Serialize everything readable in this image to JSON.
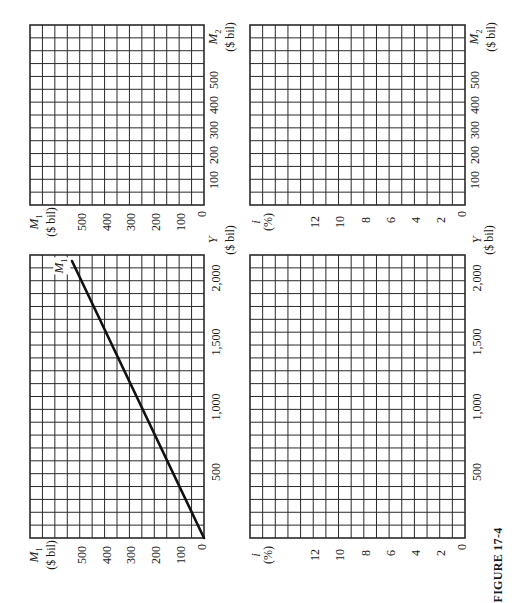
{
  "figure": {
    "caption": "FIGURE 17-4",
    "orientation": "page rotated 90° counter-clockwise"
  },
  "panels": {
    "top_left": {
      "x_axis_title": {
        "var": "M",
        "sub": "2",
        "unit": "($ bil)"
      },
      "x_ticks": [
        "100",
        "200",
        "300",
        "400",
        "500"
      ],
      "y_axis_title": {
        "var": "M",
        "sub": "1",
        "unit": "($ bil)"
      },
      "y_ticks": [
        "500",
        "400",
        "300",
        "200",
        "100",
        "0"
      ]
    },
    "top_right": {
      "x_axis_title": {
        "var": "M",
        "sub": "2",
        "unit": "($ bil)"
      },
      "x_ticks": [
        "100",
        "200",
        "300",
        "400",
        "500"
      ],
      "y_axis_title": {
        "var": "i",
        "sub": "",
        "unit": "(%)"
      },
      "y_ticks": [
        "12",
        "10",
        "8",
        "6",
        "4",
        "2",
        "0"
      ]
    },
    "bottom_left": {
      "x_axis_title": {
        "var": "Y",
        "sub": "",
        "unit": "($ bil)"
      },
      "x_ticks": [
        "500",
        "1,000",
        "1,500",
        "2,000"
      ],
      "y_axis_title": {
        "var": "M",
        "sub": "1",
        "unit": "($ bil)"
      },
      "y_ticks": [
        "500",
        "400",
        "300",
        "200",
        "100",
        "0"
      ],
      "line_label": {
        "var": "M",
        "sub": "1"
      }
    },
    "bottom_right": {
      "x_axis_title": {
        "var": "Y",
        "sub": "",
        "unit": "($ bil)"
      },
      "x_ticks": [
        "500",
        "1,000",
        "1,500",
        "2,000"
      ],
      "y_axis_title": {
        "var": "i",
        "sub": "",
        "unit": "(%)"
      },
      "y_ticks": [
        "12",
        "10",
        "8",
        "6",
        "4",
        "2",
        "0"
      ]
    }
  },
  "chart_data": [
    {
      "type": "line",
      "title": "Top-left: M1 vs M2 (blank grid)",
      "xlabel": "M2 ($ bil)",
      "ylabel": "M1 ($ bil)",
      "xlim": [
        0,
        560
      ],
      "ylim": [
        0,
        560
      ],
      "x_ticks": [
        100,
        200,
        300,
        400,
        500
      ],
      "y_ticks": [
        0,
        100,
        200,
        300,
        400,
        500
      ],
      "grid": true,
      "series": []
    },
    {
      "type": "line",
      "title": "Top-right: i vs M2 (blank grid)",
      "xlabel": "M2 ($ bil)",
      "ylabel": "i (%)",
      "xlim": [
        0,
        560
      ],
      "ylim": [
        0,
        14
      ],
      "x_ticks": [
        100,
        200,
        300,
        400,
        500
      ],
      "y_ticks": [
        0,
        2,
        4,
        6,
        8,
        10,
        12
      ],
      "grid": true,
      "series": []
    },
    {
      "type": "line",
      "title": "Bottom-left: M1 vs Y",
      "xlabel": "Y ($ bil)",
      "ylabel": "M1 ($ bil)",
      "xlim": [
        0,
        2180
      ],
      "ylim": [
        0,
        560
      ],
      "x_ticks": [
        500,
        1000,
        1500,
        2000
      ],
      "y_ticks": [
        0,
        100,
        200,
        300,
        400,
        500
      ],
      "grid": true,
      "series": [
        {
          "name": "M1",
          "x": [
            0,
            500,
            1000,
            1500,
            2000,
            2130
          ],
          "y": [
            0,
            125,
            250,
            375,
            500,
            532
          ]
        }
      ],
      "annotations": [
        "M1 (line label near top end)"
      ]
    },
    {
      "type": "line",
      "title": "Bottom-right: i vs Y (blank grid)",
      "xlabel": "Y ($ bil)",
      "ylabel": "i (%)",
      "xlim": [
        0,
        2180
      ],
      "ylim": [
        0,
        14
      ],
      "x_ticks": [
        500,
        1000,
        1500,
        2000
      ],
      "y_ticks": [
        0,
        2,
        4,
        6,
        8,
        10,
        12
      ],
      "grid": true,
      "series": []
    }
  ],
  "colors": {
    "ink": "#1a1a1a",
    "grid": "#2a2a2a",
    "paper": "#ffffff"
  }
}
